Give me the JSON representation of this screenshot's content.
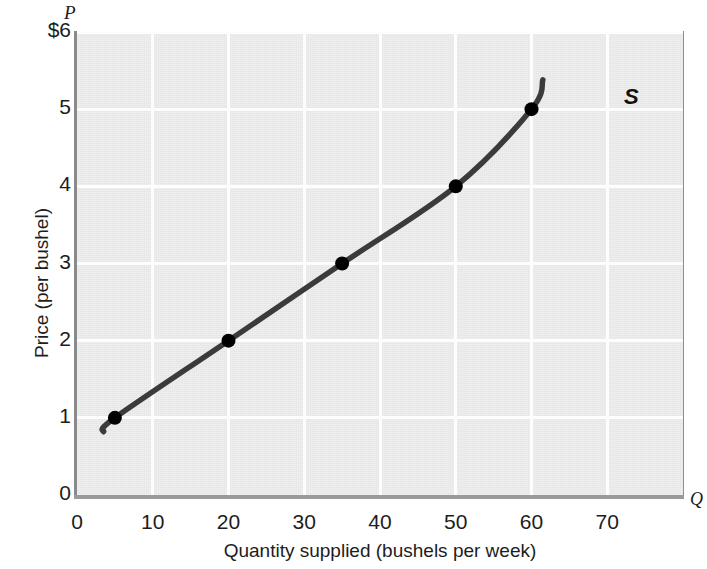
{
  "figure": {
    "p_axis_symbol": "P",
    "q_axis_symbol": "Q",
    "curve_label": "S"
  },
  "chart_data": {
    "type": "line",
    "title": "",
    "subtitle": "",
    "xlabel": "Quantity supplied (bushels per week)",
    "ylabel": "Price (per bushel)",
    "x_axis_symbol": "Q",
    "y_axis_symbol": "P",
    "xlim": [
      0,
      80
    ],
    "ylim": [
      0,
      6
    ],
    "grid": true,
    "legend": "none",
    "xticks": [
      0,
      10,
      20,
      30,
      40,
      50,
      60,
      70
    ],
    "xtick_labels": [
      "0",
      "10",
      "20",
      "30",
      "40",
      "50",
      "60",
      "70"
    ],
    "yticks": [
      0,
      1,
      2,
      3,
      4,
      5,
      6
    ],
    "ytick_labels": [
      "0",
      "1",
      "2",
      "3",
      "4",
      "5",
      "$6"
    ],
    "series": [
      {
        "name": "S",
        "annotation": "S",
        "color": "#3b3b3b",
        "marker_color": "#000000",
        "x": [
          5,
          20,
          35,
          50,
          60
        ],
        "y": [
          1,
          2,
          3,
          4,
          5
        ],
        "points": [
          {
            "q": 5,
            "p": 1
          },
          {
            "q": 20,
            "p": 2
          },
          {
            "q": 35,
            "p": 3
          },
          {
            "q": 50,
            "p": 4
          },
          {
            "q": 60,
            "p": 5
          }
        ],
        "curve_start": {
          "q": 3.5,
          "p": 0.82
        },
        "curve_end": {
          "q": 61.5,
          "p": 5.38
        }
      }
    ]
  },
  "colors": {
    "plot_background": "#e6e6e6",
    "gridline": "#fdfdfd",
    "curve": "#3b3b3b",
    "marker": "#000000",
    "frame": "#8a8a8a",
    "text": "#1d1d1d"
  }
}
